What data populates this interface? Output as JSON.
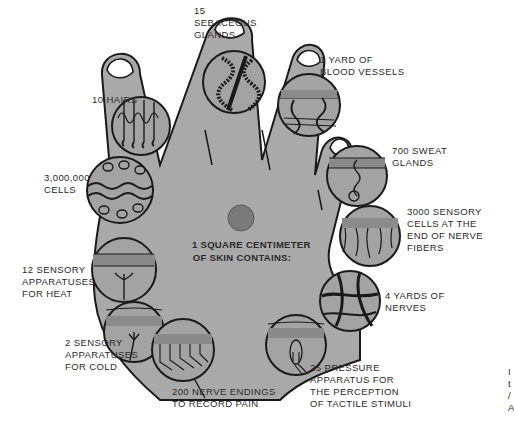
{
  "diagram": {
    "center_title": "1 SQUARE CENTIMETER\nOF SKIN CONTAINS:",
    "colors": {
      "hand_fill": "#a9a9a9",
      "circle_fill": "#a3a3a3",
      "outline": "#1a1a1a",
      "center_dot": "#7a7a7a",
      "text": "#2a2a2a",
      "background": "#ffffff"
    },
    "insets": [
      {
        "id": "hairs",
        "label": "10 HAIRS"
      },
      {
        "id": "sebaceous",
        "label": "15\nSEBACEOUS\nGLANDS"
      },
      {
        "id": "blood",
        "label": "1 YARD OF\nBLOOD VESSELS"
      },
      {
        "id": "sweat",
        "label": "700 SWEAT\nGLANDS"
      },
      {
        "id": "cells",
        "label": "3,000,000\nCELLS"
      },
      {
        "id": "sensory_cells",
        "label": "3000 SENSORY\nCELLS AT THE\nEND OF NERVE\nFIBERS"
      },
      {
        "id": "heat",
        "label": "12 SENSORY\nAPPARATUSES\nFOR HEAT"
      },
      {
        "id": "nerves",
        "label": "4 YARDS OF\nNERVES"
      },
      {
        "id": "cold",
        "label": "2 SENSORY\nAPPARATUSES\nFOR COLD"
      },
      {
        "id": "pain",
        "label": "200 NERVE ENDINGS\nTO RECORD PAIN"
      },
      {
        "id": "pressure",
        "label": "25 PRESSURE\nAPPARATUS FOR\nTHE PERCEPTION\nOF TACTILE STIMULI"
      }
    ],
    "edge_fragment": "I\nt\n/\nA"
  }
}
